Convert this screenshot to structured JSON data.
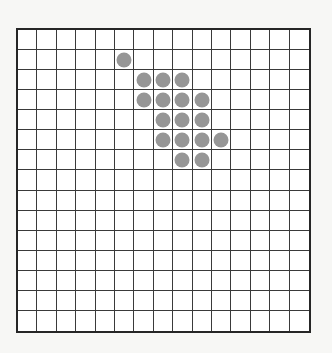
{
  "board": {
    "title": "15x15 dot grid",
    "rows": 15,
    "columns": 15,
    "cell_width_px": 19.67,
    "cell_height_px": 20.33,
    "origin_x_px": 16,
    "origin_y_px": 28,
    "board_width_px": 295,
    "board_height_px": 305
  },
  "colors": {
    "page_background": "#f7f7f5",
    "board_background": "#ffffff",
    "board_border": "#262626",
    "grid_line": "#3a3a3a",
    "stone_fill": "#969696"
  },
  "stones": {
    "shape": "circle",
    "diameter_px": 15,
    "count": 17,
    "cells": [
      {
        "row": 1,
        "col": 5
      },
      {
        "row": 2,
        "col": 6
      },
      {
        "row": 2,
        "col": 7
      },
      {
        "row": 2,
        "col": 8
      },
      {
        "row": 3,
        "col": 6
      },
      {
        "row": 3,
        "col": 7
      },
      {
        "row": 3,
        "col": 8
      },
      {
        "row": 3,
        "col": 9
      },
      {
        "row": 4,
        "col": 7
      },
      {
        "row": 4,
        "col": 8
      },
      {
        "row": 4,
        "col": 9
      },
      {
        "row": 5,
        "col": 7
      },
      {
        "row": 5,
        "col": 8
      },
      {
        "row": 5,
        "col": 9
      },
      {
        "row": 5,
        "col": 10
      },
      {
        "row": 6,
        "col": 8
      },
      {
        "row": 6,
        "col": 9
      }
    ]
  }
}
